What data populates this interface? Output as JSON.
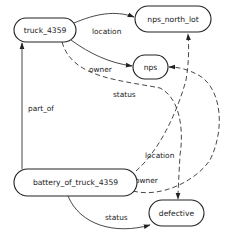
{
  "diagram": {
    "type": "knowledge-graph",
    "nodes": [
      {
        "id": "truck_4359",
        "label": "truck_4359"
      },
      {
        "id": "nps_north_lot",
        "label": "nps_north_lot"
      },
      {
        "id": "nps",
        "label": "nps"
      },
      {
        "id": "battery_of_truck_4359",
        "label": "battery_of_truck_4359"
      },
      {
        "id": "defective",
        "label": "defective"
      }
    ],
    "edges": [
      {
        "from": "truck_4359",
        "to": "nps_north_lot",
        "label": "location",
        "style": "solid"
      },
      {
        "from": "truck_4359",
        "to": "nps",
        "label": "owner",
        "style": "solid"
      },
      {
        "from": "truck_4359",
        "to": "defective",
        "label": "status",
        "style": "dashed"
      },
      {
        "from": "battery_of_truck_4359",
        "to": "truck_4359",
        "label": "part_of",
        "style": "solid"
      },
      {
        "from": "battery_of_truck_4359",
        "to": "nps_north_lot",
        "label": "location",
        "style": "dashed"
      },
      {
        "from": "battery_of_truck_4359",
        "to": "nps",
        "label": "owner",
        "style": "dashed"
      },
      {
        "from": "battery_of_truck_4359",
        "to": "defective",
        "label": "status",
        "style": "solid"
      }
    ]
  },
  "colors": {
    "stroke": "#222222",
    "background": "#ffffff"
  }
}
